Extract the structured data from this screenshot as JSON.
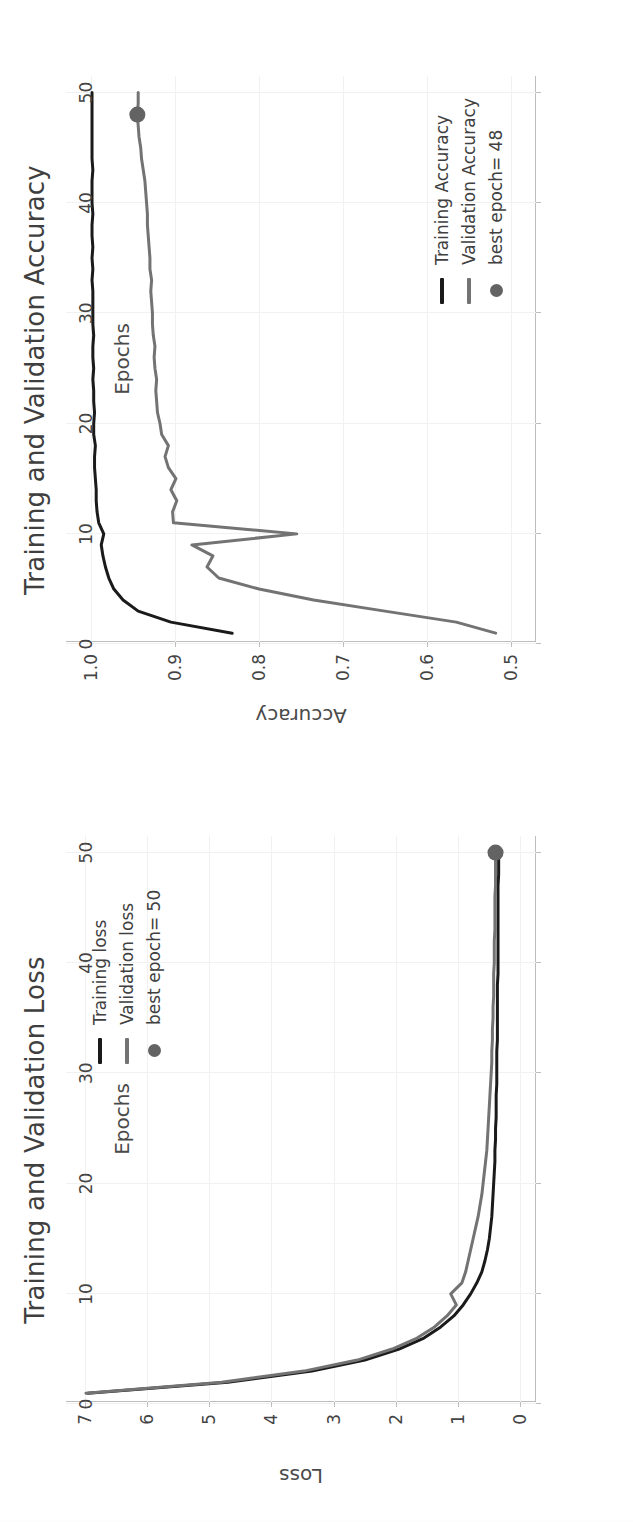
{
  "page": {
    "background": "#fdfdfd",
    "orientation": "rotated-90-clockwise"
  },
  "colors": {
    "training": "#1a1a1a",
    "validation": "#737373",
    "marker": "#636363",
    "grid": "#f1f1f1",
    "axis": "#bdbdbd",
    "text": "#444444"
  },
  "charts": [
    {
      "id": "accuracy",
      "title": "Training and Validation Accuracy",
      "xlabel": "Epochs",
      "ylabel": "Accuracy",
      "legend": {
        "training_label": "Training Accuracy",
        "validation_label": "Validation Accuracy",
        "marker_label": "best epoch= 48"
      },
      "xticks": [
        "0",
        "10",
        "20",
        "30",
        "40",
        "50"
      ],
      "yticks": [
        "0.5",
        "0.6",
        "0.7",
        "0.8",
        "0.9",
        "1.0"
      ]
    },
    {
      "id": "loss",
      "title": "Training and Validation Loss",
      "xlabel": "Epochs",
      "ylabel": "Loss",
      "legend": {
        "training_label": "Training loss",
        "validation_label": "Validation loss",
        "marker_label": "best epoch= 50"
      },
      "xticks": [
        "0",
        "10",
        "20",
        "30",
        "40",
        "50"
      ],
      "yticks": [
        "0",
        "1",
        "2",
        "3",
        "4",
        "5",
        "6",
        "7"
      ]
    }
  ],
  "chart_data": [
    {
      "type": "line",
      "title": "Training and Validation Accuracy",
      "xlabel": "Epochs",
      "ylabel": "Accuracy",
      "xlim": [
        0.2,
        51.5
      ],
      "ylim": [
        0.47,
        1.03
      ],
      "grid": true,
      "legend_position": "lower-right",
      "x": [
        1,
        2,
        3,
        4,
        5,
        6,
        7,
        8,
        9,
        10,
        11,
        12,
        13,
        14,
        15,
        16,
        17,
        18,
        19,
        20,
        21,
        22,
        23,
        24,
        25,
        26,
        27,
        28,
        29,
        30,
        31,
        32,
        33,
        34,
        35,
        36,
        37,
        38,
        39,
        40,
        41,
        42,
        43,
        44,
        45,
        46,
        47,
        48,
        49,
        50
      ],
      "series": [
        {
          "name": "Training Accuracy",
          "color": "#1a1a1a",
          "values": [
            0.832,
            0.905,
            0.944,
            0.962,
            0.973,
            0.979,
            0.983,
            0.986,
            0.988,
            0.985,
            0.991,
            0.993,
            0.994,
            0.994,
            0.995,
            0.996,
            0.996,
            0.995,
            0.997,
            0.997,
            0.996,
            0.997,
            0.997,
            0.998,
            0.997,
            0.998,
            0.998,
            0.997,
            0.998,
            0.998,
            0.998,
            0.998,
            0.999,
            0.998,
            0.999,
            0.998,
            0.999,
            0.999,
            0.998,
            0.999,
            0.999,
            0.999,
            0.998,
            0.999,
            0.999,
            0.999,
            0.999,
            0.999,
            0.999,
            0.999
          ]
        },
        {
          "name": "Validation Accuracy",
          "color": "#737373",
          "values": [
            0.518,
            0.565,
            0.65,
            0.735,
            0.8,
            0.848,
            0.862,
            0.855,
            0.88,
            0.755,
            0.902,
            0.903,
            0.898,
            0.905,
            0.899,
            0.908,
            0.912,
            0.908,
            0.916,
            0.918,
            0.921,
            0.922,
            0.923,
            0.922,
            0.924,
            0.925,
            0.924,
            0.926,
            0.927,
            0.927,
            0.928,
            0.929,
            0.928,
            0.93,
            0.93,
            0.931,
            0.932,
            0.933,
            0.933,
            0.934,
            0.935,
            0.936,
            0.938,
            0.94,
            0.941,
            0.943,
            0.944,
            0.945,
            0.944,
            0.944
          ]
        }
      ],
      "marker": {
        "label": "best epoch= 48",
        "x": 48,
        "y": 0.945,
        "color": "#636363"
      }
    },
    {
      "type": "line",
      "title": "Training and Validation Loss",
      "xlabel": "Epochs",
      "ylabel": "Loss",
      "xlim": [
        0.2,
        51.5
      ],
      "ylim": [
        -0.25,
        7.3
      ],
      "grid": true,
      "legend_position": "upper-right",
      "x": [
        1,
        2,
        3,
        4,
        5,
        6,
        7,
        8,
        9,
        10,
        11,
        12,
        13,
        14,
        15,
        16,
        17,
        18,
        19,
        20,
        21,
        22,
        23,
        24,
        25,
        26,
        27,
        28,
        29,
        30,
        31,
        32,
        33,
        34,
        35,
        36,
        37,
        38,
        39,
        40,
        41,
        42,
        43,
        44,
        45,
        46,
        47,
        48,
        49,
        50
      ],
      "series": [
        {
          "name": "Training loss",
          "color": "#1a1a1a",
          "values": [
            6.95,
            4.7,
            3.35,
            2.5,
            1.95,
            1.55,
            1.28,
            1.07,
            0.92,
            0.8,
            0.7,
            0.62,
            0.57,
            0.53,
            0.5,
            0.48,
            0.46,
            0.45,
            0.44,
            0.43,
            0.42,
            0.41,
            0.41,
            0.4,
            0.4,
            0.39,
            0.39,
            0.39,
            0.38,
            0.38,
            0.38,
            0.38,
            0.37,
            0.37,
            0.37,
            0.37,
            0.37,
            0.37,
            0.36,
            0.36,
            0.36,
            0.36,
            0.36,
            0.36,
            0.36,
            0.36,
            0.36,
            0.35,
            0.35,
            0.35
          ]
        },
        {
          "name": "Validation loss",
          "color": "#737373",
          "values": [
            6.98,
            4.8,
            3.48,
            2.62,
            2.06,
            1.66,
            1.38,
            1.18,
            1.03,
            1.12,
            0.94,
            0.88,
            0.84,
            0.8,
            0.76,
            0.72,
            0.68,
            0.65,
            0.62,
            0.6,
            0.58,
            0.56,
            0.54,
            0.53,
            0.52,
            0.51,
            0.5,
            0.49,
            0.48,
            0.47,
            0.46,
            0.46,
            0.45,
            0.45,
            0.44,
            0.44,
            0.43,
            0.43,
            0.43,
            0.42,
            0.42,
            0.42,
            0.41,
            0.41,
            0.41,
            0.41,
            0.4,
            0.4,
            0.4,
            0.4
          ]
        }
      ],
      "marker": {
        "label": "best epoch= 50",
        "x": 50,
        "y": 0.4,
        "color": "#636363"
      }
    }
  ]
}
